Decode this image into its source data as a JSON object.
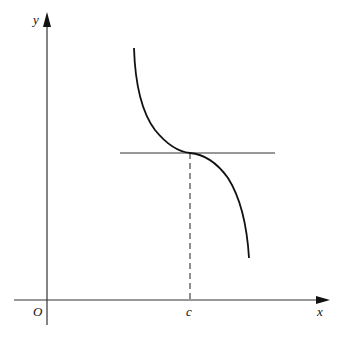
{
  "diagram": {
    "labels": {
      "y_axis": "y",
      "x_axis": "x",
      "origin": "O",
      "point": "c"
    },
    "colors": {
      "stroke": "#1a1a1a",
      "axis": "#333333",
      "background": "#ffffff"
    },
    "elements": {
      "curve": "decreasing curve with inflection point at x=c",
      "tangent": "horizontal tangent line at x=c",
      "dashed": "vertical dashed line from curve down to x-axis at c"
    }
  }
}
